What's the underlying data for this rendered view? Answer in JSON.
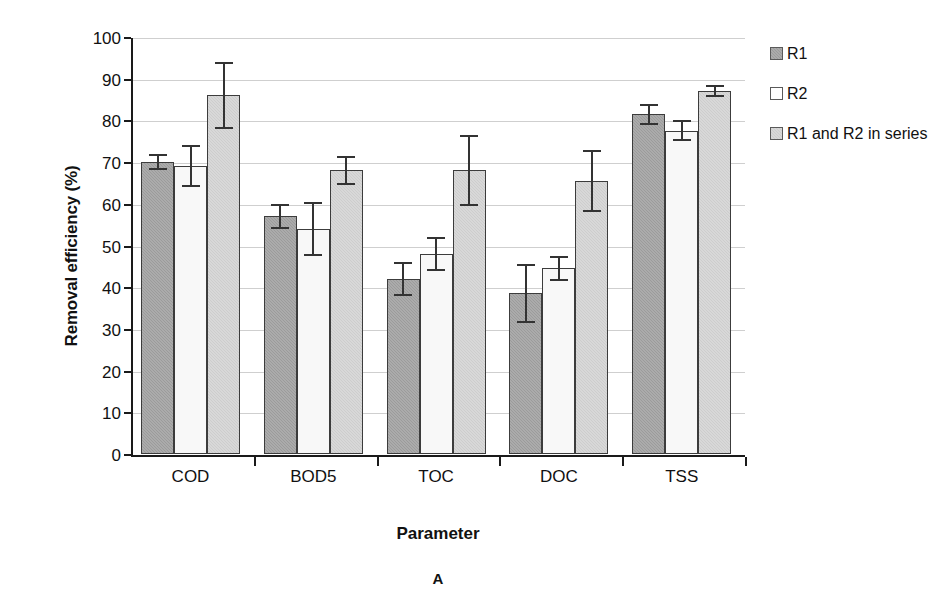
{
  "chart_data": {
    "type": "bar",
    "title": "",
    "xlabel": "Parameter",
    "ylabel": "Removal efficiency (%)",
    "panel_label": "A",
    "categories": [
      "COD",
      "BOD5",
      "TOC",
      "DOC",
      "TSS"
    ],
    "ylim": [
      0,
      100
    ],
    "ytick_step": 10,
    "yticks": [
      0,
      10,
      20,
      30,
      40,
      50,
      60,
      70,
      80,
      90,
      100
    ],
    "ytick_labels": [
      "0",
      "10",
      "20",
      "30",
      "40",
      "50",
      "60",
      "70",
      "80",
      "90",
      "100"
    ],
    "grid": true,
    "grid_axis": "y",
    "legend_position": "right",
    "series": [
      {
        "name": "R1",
        "color": "#9b9b9b",
        "values": [
          70.0,
          57.0,
          42.0,
          38.5,
          81.5
        ],
        "errors": [
          2.0,
          3.0,
          4.0,
          7.0,
          2.5
        ]
      },
      {
        "name": "R2",
        "color": "#f8f8f8",
        "values": [
          69.0,
          54.0,
          48.0,
          44.5,
          77.5
        ],
        "errors": [
          5.0,
          6.5,
          4.0,
          3.0,
          2.5
        ]
      },
      {
        "name": "R1 and R2 in series",
        "color": "#cdcdcd",
        "values": [
          86.0,
          68.0,
          68.0,
          65.5,
          87.0
        ],
        "errors": [
          8.0,
          3.5,
          8.5,
          7.5,
          1.5
        ]
      }
    ]
  },
  "legend": {
    "items": [
      {
        "label": "R1"
      },
      {
        "label": "R2"
      },
      {
        "label": "R1 and R2 in series"
      }
    ]
  },
  "axes": {
    "y_title": "Removal efficiency (%)",
    "x_title": "Parameter"
  },
  "figure": {
    "panel": "A"
  }
}
